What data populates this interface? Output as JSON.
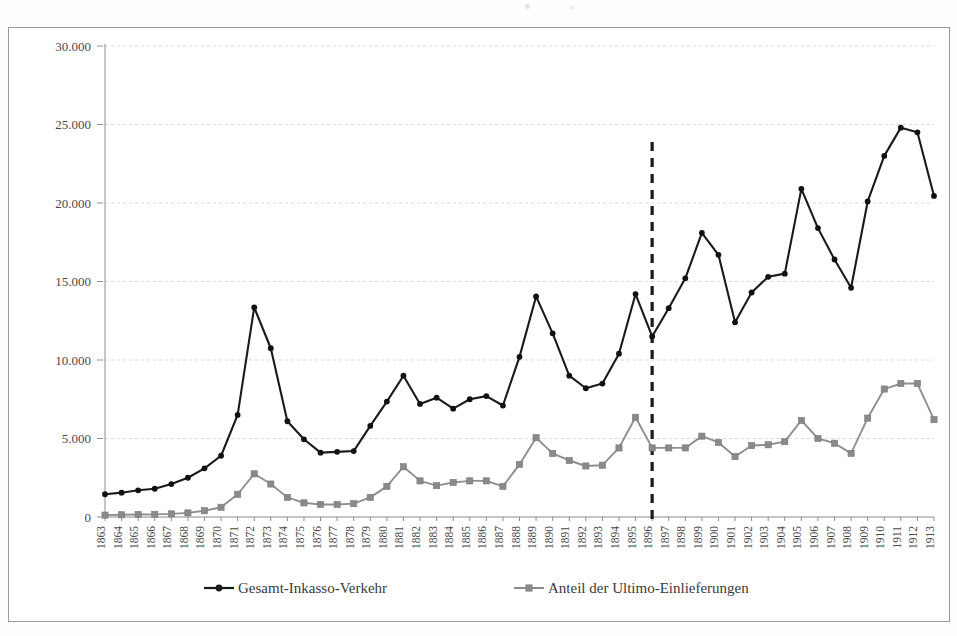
{
  "figure": {
    "background_color": "#ffffff",
    "frame_color": "#9a9a9a"
  },
  "legend": {
    "position": "bottom",
    "items": [
      {
        "label": "Gesamt-Inkasso-Verkehr",
        "color": "#1a1a1a",
        "marker": "diamond-icon"
      },
      {
        "label": "Anteil der Ultimo-Einlieferungen",
        "color": "#8a8a8a",
        "marker": "square-icon"
      }
    ]
  },
  "annotation": {
    "event_line_year": "1896",
    "event_line_color": "#1a1a1a",
    "event_line_style": "dashed"
  },
  "chart_data": {
    "type": "line",
    "title": "",
    "subtitle": "",
    "xlabel": "",
    "ylabel": "",
    "ylim": [
      0,
      30000
    ],
    "yticks": [
      0,
      5000,
      10000,
      15000,
      20000,
      25000,
      30000
    ],
    "ytick_labels": [
      "0",
      "5.000",
      "10.000",
      "15.000",
      "20.000",
      "25.000",
      "30.000"
    ],
    "grid": true,
    "grid_axis": "y",
    "legend_position": "bottom",
    "x": [
      "1863",
      "1864",
      "1865",
      "1866",
      "1867",
      "1868",
      "1869",
      "1870",
      "1871",
      "1872",
      "1873",
      "1874",
      "1875",
      "1876",
      "1877",
      "1878",
      "1879",
      "1880",
      "1881",
      "1882",
      "1883",
      "1884",
      "1885",
      "1886",
      "1887",
      "1888",
      "1889",
      "1890",
      "1891",
      "1892",
      "1893",
      "1894",
      "1895",
      "1896",
      "1897",
      "1898",
      "1899",
      "1900",
      "1901",
      "1902",
      "1903",
      "1904",
      "1905",
      "1906",
      "1907",
      "1908",
      "1909",
      "1910",
      "1911",
      "1912",
      "1913"
    ],
    "series": [
      {
        "name": "Gesamt-Inkasso-Verkehr",
        "color": "#1a1a1a",
        "marker": "diamond",
        "values": [
          1450,
          1550,
          1700,
          1800,
          2100,
          2500,
          3100,
          3900,
          6500,
          13350,
          10750,
          6100,
          4950,
          4100,
          4150,
          4200,
          5800,
          7350,
          9000,
          7200,
          7600,
          6900,
          7500,
          7700,
          7100,
          10200,
          14050,
          11700,
          9000,
          8200,
          8500,
          10400,
          14200,
          11500,
          13300,
          15200,
          18100,
          16700,
          12400,
          14300,
          15300,
          15500,
          20900,
          18400,
          16400,
          14600,
          20100,
          23000,
          24800,
          24500,
          20450
        ]
      },
      {
        "name": "Anteil der Ultimo-Einlieferungen",
        "color": "#8a8a8a",
        "marker": "square",
        "values": [
          120,
          140,
          160,
          170,
          200,
          260,
          400,
          620,
          1450,
          2750,
          2100,
          1250,
          900,
          800,
          800,
          850,
          1250,
          1950,
          3200,
          2300,
          2000,
          2200,
          2300,
          2300,
          1950,
          3350,
          5050,
          4050,
          3600,
          3250,
          3300,
          4400,
          6350,
          4400,
          4400,
          4400,
          5150,
          4750,
          3850,
          4550,
          4600,
          4800,
          6150,
          5000,
          4700,
          4050,
          6300,
          8150,
          8500,
          8500,
          6200
        ]
      }
    ]
  }
}
